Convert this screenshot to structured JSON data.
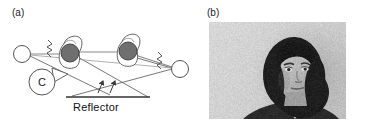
{
  "figure": {
    "panels": [
      {
        "id": "a",
        "label": "(a)",
        "type": "schematic-diagram",
        "caption_text": "Reflector"
      },
      {
        "id": "b",
        "label": "(b)",
        "type": "photograph",
        "subject": "portrait of a woman with dark shoulder-length hair, grayscale"
      }
    ]
  },
  "diagram": {
    "labels": {
      "reflector": "Reflector",
      "camera": "C"
    },
    "elements": {
      "source_left": "open-circle-sound-source",
      "source_right": "open-circle-sound-source",
      "head_left": "head-with-microphone",
      "head_right": "head-with-microphone",
      "camera_symbol": "camera-icon-labeled-C",
      "reflector_surface": "horizontal-reflector-line",
      "reflection_arrows": 2,
      "zigzag_symbols": 2,
      "direct_paths": 2,
      "reflected_paths": 4
    },
    "colors": {
      "stroke": "#444444",
      "fill_dark": "#6f6f6f",
      "text": "#111111",
      "background": "#ffffff"
    }
  },
  "photo": {
    "alt": "(b) grayscale portrait photograph",
    "frame_border": "#b0b0b0",
    "background_tone": "#c8c8c8"
  }
}
